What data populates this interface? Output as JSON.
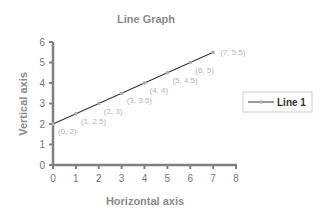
{
  "chart_data": {
    "type": "line",
    "title": "Line Graph",
    "xlabel": "Horizontal axis",
    "ylabel": "Vertical axis",
    "xlim": [
      0,
      8
    ],
    "ylim": [
      0,
      6
    ],
    "x_ticks": [
      0,
      1,
      2,
      3,
      4,
      5,
      6,
      7,
      8
    ],
    "y_ticks": [
      0,
      1,
      2,
      3,
      4,
      5,
      6
    ],
    "grid": false,
    "legend_position": "right",
    "series": [
      {
        "name": "Line 1",
        "x": [
          0,
          1,
          2,
          3,
          4,
          5,
          6,
          7
        ],
        "values": [
          2,
          2.5,
          3,
          3.5,
          4,
          4.5,
          5,
          5.5
        ],
        "point_labels": [
          "(0, 2)",
          "(1, 2.5)",
          "(2, 3)",
          "(3, 3.5)",
          "(4, 4)",
          "(5, 4.5)",
          "(6, 5)",
          "(7, 5.5)"
        ]
      }
    ]
  },
  "colors": {
    "line": "#333333",
    "marker": "#aaaaaa",
    "axis": "#808080",
    "title": "#8a8a8a",
    "point_label": "#b5b5b5"
  },
  "legend": {
    "label": "Line 1"
  }
}
